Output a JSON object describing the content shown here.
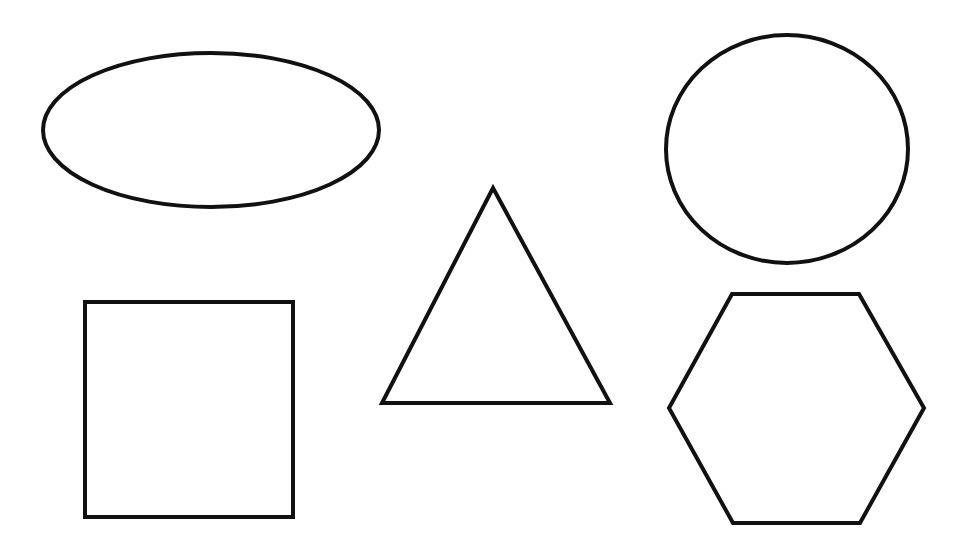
{
  "canvas": {
    "width": 972,
    "height": 550,
    "background": "#ffffff"
  },
  "style": {
    "stroke": "#111111",
    "stroke_width": 4,
    "fill": "none"
  },
  "shapes": [
    {
      "id": "ellipse",
      "type": "ellipse",
      "cx": 211,
      "cy": 130,
      "rx": 168,
      "ry": 77
    },
    {
      "id": "circle",
      "type": "ellipse",
      "cx": 787,
      "cy": 149,
      "rx": 121,
      "ry": 114
    },
    {
      "id": "triangle",
      "type": "polygon",
      "points": "493,188 610,403 382,403"
    },
    {
      "id": "square",
      "type": "rect",
      "x": 85,
      "y": 302,
      "width": 208,
      "height": 215
    },
    {
      "id": "hexagon",
      "type": "polygon",
      "points": "732,294 859,294 924,408 860,523 733,523 669,408"
    }
  ]
}
